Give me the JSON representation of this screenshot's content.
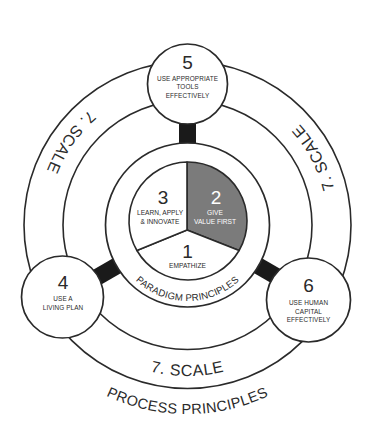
{
  "diagram": {
    "paradigm": {
      "label": "PARADIGM PRINCIPLES",
      "segments": [
        {
          "number": "1",
          "lines": [
            "EMPATHIZE"
          ]
        },
        {
          "number": "2",
          "lines": [
            "GIVE",
            "VALUE FIRST"
          ],
          "highlighted": true
        },
        {
          "number": "3",
          "lines": [
            "LEARN, APPLY",
            "& INNOVATE"
          ]
        }
      ]
    },
    "process": {
      "label": "PROCESS PRINCIPLES",
      "nodes": [
        {
          "number": "4",
          "lines": [
            "USE A",
            "LIVING PLAN"
          ]
        },
        {
          "number": "5",
          "lines": [
            "USE APPROPRIATE",
            "TOOLS",
            "EFFECTIVELY"
          ]
        },
        {
          "number": "6",
          "lines": [
            "USE HUMAN",
            "CAPITAL",
            "EFFECTIVELY"
          ]
        }
      ]
    },
    "scale": {
      "labels": [
        "7. SCALE",
        "7. SCALE",
        "7. SCALE"
      ]
    }
  },
  "colors": {
    "stroke": "#2a2a2a",
    "highlight_segment": "#7b7b7b",
    "connector": "#1a1a1a",
    "background": "#ffffff"
  }
}
